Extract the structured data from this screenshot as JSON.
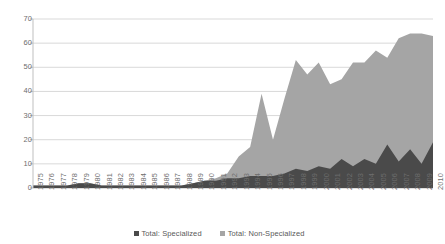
{
  "chart_data": {
    "type": "area",
    "stacked": true,
    "title": "",
    "subtitle": "",
    "xlabel": "",
    "ylabel": "",
    "ylim": [
      0,
      70
    ],
    "ytick_step": 10,
    "yticks": [
      0,
      10,
      20,
      30,
      40,
      50,
      60,
      70
    ],
    "grid": true,
    "legend_position": "bottom",
    "categories": [
      "1975",
      "1976",
      "1977",
      "1978",
      "1979",
      "1980",
      "1981",
      "1982",
      "1983",
      "1984",
      "1985",
      "1986",
      "1987",
      "1988",
      "1989",
      "1990",
      "1991",
      "1992",
      "1993",
      "1994",
      "1995",
      "1996",
      "1997",
      "1998",
      "1999",
      "2000",
      "2001",
      "2002",
      "2003",
      "2004",
      "2005",
      "2006",
      "2007",
      "2008",
      "2009",
      "2010"
    ],
    "series": [
      {
        "name": "Total: Specialized",
        "color": "#4a4a4a",
        "values": [
          1,
          1,
          1,
          1,
          2,
          2,
          1,
          1,
          1,
          1,
          1,
          1,
          1,
          1,
          2,
          3,
          3,
          4,
          4,
          5,
          5,
          5,
          6,
          8,
          7,
          9,
          8,
          12,
          9,
          12,
          10,
          18,
          11,
          16,
          10,
          19
        ]
      },
      {
        "name": "Total: Non-Specialized",
        "color": "#a5a5a5",
        "values": [
          0,
          0,
          0,
          0,
          0,
          0,
          0,
          0,
          0,
          0,
          0,
          0,
          0,
          0,
          0,
          0,
          1,
          2,
          9,
          12,
          34,
          15,
          31,
          45,
          40,
          43,
          35,
          33,
          43,
          40,
          47,
          36,
          51,
          48,
          54,
          44
        ]
      }
    ],
    "totals": [
      1,
      1,
      1,
      1,
      2,
      2,
      1,
      1,
      1,
      1,
      1,
      1,
      1,
      1,
      2,
      3,
      4,
      6,
      13,
      17,
      39,
      20,
      37,
      53,
      47,
      52,
      43,
      45,
      52,
      52,
      57,
      54,
      62,
      64,
      64,
      63
    ]
  },
  "legend": {
    "entries": [
      {
        "label": "Total: Specialized",
        "color": "#4a4a4a"
      },
      {
        "label": "Total: Non-Specialized",
        "color": "#a5a5a5"
      }
    ]
  },
  "axes": {
    "y": {
      "labels": [
        "70",
        "60",
        "50",
        "40",
        "30",
        "20",
        "10",
        "0"
      ]
    }
  }
}
